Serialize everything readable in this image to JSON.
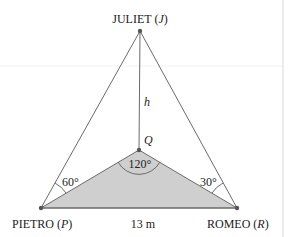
{
  "diagram": {
    "points": {
      "J": {
        "name": "JULIET",
        "letter": "J",
        "x": 140,
        "y": 31
      },
      "Q": {
        "name": "",
        "letter": "Q",
        "x": 139,
        "y": 150
      },
      "P": {
        "name": "PIETRO",
        "letter": "P",
        "x": 41,
        "y": 208
      },
      "R": {
        "name": "ROMEO",
        "letter": "R",
        "x": 237,
        "y": 208
      }
    },
    "labels": {
      "juliet_prefix": "JULIET (",
      "juliet_letter": "J",
      "juliet_suffix": ")",
      "pietro_prefix": "PIETRO (",
      "pietro_letter": "P",
      "pietro_suffix": ")",
      "romeo_prefix": "ROMEO (",
      "romeo_letter": "R",
      "romeo_suffix": ")",
      "q": "Q",
      "h": "h",
      "base": "13 m"
    },
    "angles": {
      "P": "60°",
      "Q": "120°",
      "R": "30°"
    },
    "colors": {
      "line": "#6b6b6b",
      "shade": "#cfcfcf",
      "point": "#555555",
      "text": "#222222"
    }
  }
}
